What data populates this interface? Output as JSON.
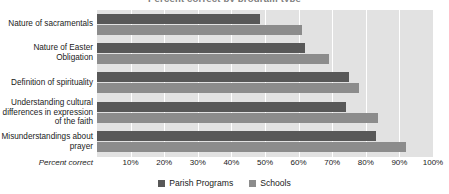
{
  "chart_data": {
    "type": "bar",
    "orientation": "horizontal",
    "title": "Percent correct by program type",
    "xlabel": "Percent correct",
    "ylabel": "",
    "xlim": [
      0,
      100
    ],
    "grid": true,
    "legend_position": "bottom",
    "tick_labels": [
      "10%",
      "20%",
      "30%",
      "40%",
      "50%",
      "60%",
      "70%",
      "80%",
      "90%",
      "100%"
    ],
    "tick_values": [
      10,
      20,
      30,
      40,
      50,
      60,
      70,
      80,
      90,
      100
    ],
    "categories": [
      "Nature of sacramentals",
      "Nature of Easter Obligation",
      "Definition of spirituality",
      "Understanding cultural differences in expression of the faith",
      "Misunderstandings about prayer"
    ],
    "series": [
      {
        "name": "Parish Programs",
        "color": "#585858",
        "values": [
          48.5,
          62,
          75,
          74,
          83
        ]
      },
      {
        "name": "Schools",
        "color": "#8c8c8c",
        "values": [
          61,
          69,
          78,
          83.5,
          92
        ]
      }
    ]
  },
  "colors": {
    "plot_background": "#e2e2e2",
    "gridline": "#ffffff",
    "parish_programs": "#585858",
    "schools": "#8c8c8c"
  }
}
